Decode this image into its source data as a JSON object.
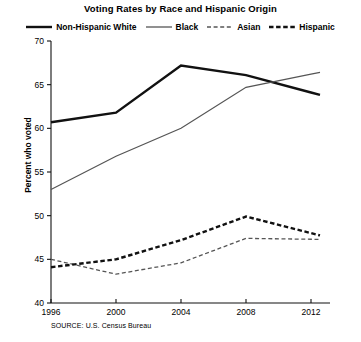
{
  "chart_data": {
    "type": "line",
    "title": "Voting Rates by Race and Hispanic Origin",
    "xlabel": "",
    "ylabel": "Percent who voted",
    "source": "SOURCE: U.S. Census Bureau",
    "categories": [
      "1996",
      "2000",
      "2004",
      "2008",
      "2012"
    ],
    "x": [
      1996,
      2000,
      2004,
      2008,
      2012
    ],
    "xlim": [
      1996,
      2012
    ],
    "ylim": [
      40,
      70
    ],
    "yticks": [
      40,
      45,
      50,
      55,
      60,
      65,
      70
    ],
    "xticks": [
      1996,
      2000,
      2004,
      2008,
      2012
    ],
    "grid": false,
    "legend_position": "top",
    "series": [
      {
        "name": "Non-Hispanic White",
        "values": [
          60.7,
          61.8,
          67.2,
          66.1,
          64.1
        ],
        "color": "#111111",
        "style": "solid",
        "width": 2.4
      },
      {
        "name": "Black",
        "values": [
          53.0,
          56.8,
          60.0,
          64.7,
          66.2
        ],
        "color": "#555555",
        "style": "solid",
        "width": 1.2
      },
      {
        "name": "Asian",
        "values": [
          45.0,
          43.3,
          44.6,
          47.4,
          47.3
        ],
        "color": "#555555",
        "style": "dashed",
        "width": 1.3
      },
      {
        "name": "Hispanic",
        "values": [
          44.1,
          45.0,
          47.2,
          49.9,
          48.0
        ],
        "color": "#111111",
        "style": "dashed",
        "width": 2.4
      }
    ]
  },
  "legend": {
    "items": [
      {
        "label": "Non-Hispanic White",
        "swatch": "solid-thick-black"
      },
      {
        "label": "Black",
        "swatch": "solid-thin-gray"
      },
      {
        "label": "Asian",
        "swatch": "dashed-thin-gray"
      },
      {
        "label": "Hispanic",
        "swatch": "dashed-thick-black"
      }
    ]
  }
}
